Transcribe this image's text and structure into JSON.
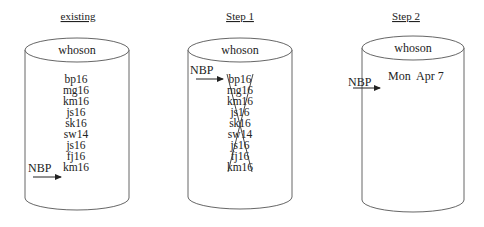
{
  "diagram": {
    "arrow_label": "NBP",
    "panels": [
      {
        "title": "existing",
        "database_label": "whoson",
        "entries": [
          "bp16",
          "mg16",
          "km16",
          "js16",
          "sk16",
          "sw14",
          "js16",
          "fj16",
          "km16"
        ],
        "nbp_points_to_index": 8,
        "crossed_out": false
      },
      {
        "title": "Step 1",
        "database_label": "whoson",
        "entries": [
          "bp16",
          "mg16",
          "km16",
          "js16",
          "sk16",
          "sw14",
          "js16",
          "fj16",
          "km16"
        ],
        "nbp_points_to_index": 0,
        "crossed_out": true
      },
      {
        "title": "Step 2",
        "database_label": "whoson",
        "entries": [
          "Mon  Apr 7"
        ],
        "nbp_points_to_index": 0,
        "crossed_out": false
      }
    ]
  }
}
